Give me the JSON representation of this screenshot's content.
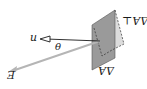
{
  "diagram": {
    "title": "",
    "orientation": "rotated 180 degrees",
    "labels": {
      "area": "ΔA",
      "perpendicular_area": "ΔA⊥",
      "normal": "n",
      "angle": "θ",
      "field": "E"
    },
    "elements": [
      {
        "id": "plate",
        "kind": "tilted flat surface",
        "fill": "#9a9a9a"
      },
      {
        "id": "projected-plate",
        "kind": "dashed projected area",
        "fill": "#d8d8d8"
      },
      {
        "id": "normal-vector",
        "kind": "arrow",
        "color": "#1a1a1a"
      },
      {
        "id": "field-vector",
        "kind": "arrow",
        "color": "#b8b8b8"
      }
    ],
    "colors": {
      "plate": "#9a9a9a",
      "projection": "#dcdcdc",
      "field_arrow": "#b5b5b5",
      "ink": "#1a1a1a"
    }
  }
}
